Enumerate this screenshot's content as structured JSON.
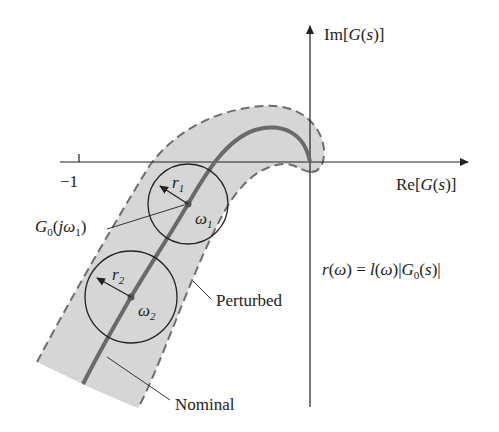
{
  "diagram": {
    "type": "nyquist-uncertainty-band",
    "axes": {
      "real_label": "Re[G(s)]",
      "imag_label": "Im[G(s)]",
      "tick_label": "−1"
    },
    "curves": {
      "nominal_label": "Nominal",
      "perturbed_label": "Perturbed"
    },
    "circles": [
      {
        "radius_label": "r",
        "radius_sub": "1",
        "freq_label": "ω",
        "freq_sub": "1"
      },
      {
        "radius_label": "r",
        "radius_sub": "2",
        "freq_label": "ω",
        "freq_sub": "2"
      }
    ],
    "point_label": {
      "main": "G",
      "sub": "0",
      "arg_open": "(",
      "arg_j": "j",
      "arg_w": "ω",
      "arg_sub": "1",
      "arg_close": ")"
    },
    "formula": {
      "lhs": "r(ω)",
      "eq": " = ",
      "rhs_l": "l(ω)",
      "rhs_abs_open": "|",
      "rhs_g": "G",
      "rhs_sub": "0",
      "rhs_arg": "(s)",
      "rhs_abs_close": "|"
    },
    "colors": {
      "band_fill": "#d6d6d6",
      "band_outline": "#6e6e6e",
      "nominal_curve": "#6a6a6a",
      "axes": "#222222",
      "circle": "#222222"
    }
  }
}
